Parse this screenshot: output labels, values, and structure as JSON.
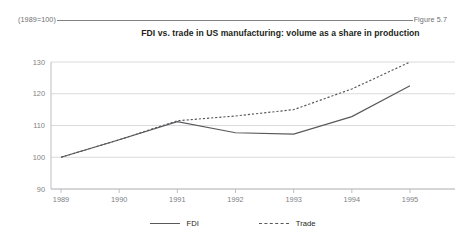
{
  "header": {
    "index_note": "(1989=100)",
    "figure_number": "Figure 5.7"
  },
  "chart_data": {
    "type": "line",
    "title": "FDI vs. trade in US manufacturing: volume as a share in production",
    "xlabel": "",
    "ylabel": "",
    "categories": [
      "1989",
      "1990",
      "1991",
      "1992",
      "1993",
      "1994",
      "1995"
    ],
    "x": [
      1989,
      1990,
      1991,
      1992,
      1993,
      1994,
      1995
    ],
    "series": [
      {
        "name": "FDI",
        "style": "solid",
        "color": "#58595b",
        "values": [
          100,
          105.5,
          111.2,
          107.7,
          107.3,
          112.8,
          122.5
        ]
      },
      {
        "name": "Trade",
        "style": "dashed",
        "color": "#58595b",
        "values": [
          100,
          105.5,
          111.5,
          113.0,
          115.0,
          121.5,
          130.0
        ]
      }
    ],
    "ylim": [
      90,
      130
    ],
    "yticks": [
      90,
      100,
      110,
      120,
      130
    ],
    "ytick_labels": [
      "90",
      "100",
      "110",
      "120",
      "130"
    ],
    "xtick_labels": [
      "1989",
      "1990",
      "1991",
      "1992",
      "1993",
      "1994",
      "1995"
    ],
    "grid": true,
    "grid_axis": "y",
    "legend_position": "bottom-center",
    "legend": [
      "FDI",
      "Trade"
    ]
  },
  "legend": {
    "fdi_label": "FDI",
    "trade_label": "Trade"
  }
}
